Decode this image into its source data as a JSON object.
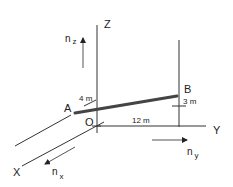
{
  "diagram": {
    "axes": {
      "x_label": "X",
      "y_label": "Y",
      "z_label": "Z",
      "origin_label": "O"
    },
    "points": {
      "a_label": "A",
      "b_label": "B"
    },
    "dimensions": {
      "ax_offset": "4 m",
      "bz_height": "3 m",
      "by_distance": "12 m"
    },
    "unit_vectors": {
      "nx": {
        "base": "n",
        "sub": "x"
      },
      "ny": {
        "base": "n",
        "sub": "y"
      },
      "nz": {
        "base": "n",
        "sub": "z"
      }
    },
    "colors": {
      "line": "#333333",
      "rod": "#444444"
    }
  }
}
